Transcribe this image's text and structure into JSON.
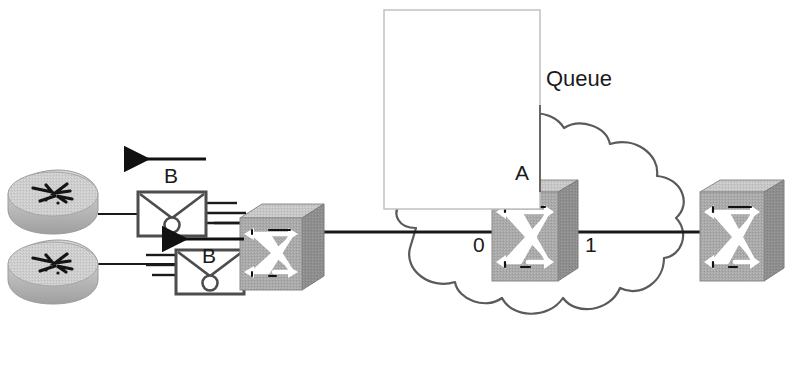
{
  "diagram": {
    "type": "network-topology",
    "title": "",
    "background_color": "#ffffff",
    "labels": {
      "queue": "Queue",
      "switch_a": "A",
      "port_0": "0",
      "port_1": "1",
      "traffic_top": "B",
      "traffic_bottom": "B"
    },
    "nodes": [
      {
        "id": "router-top",
        "kind": "router-icon",
        "label": ""
      },
      {
        "id": "router-bottom",
        "kind": "router-icon",
        "label": ""
      },
      {
        "id": "envelope-top",
        "kind": "envelope-icon",
        "label": ""
      },
      {
        "id": "envelope-bottom",
        "kind": "envelope-icon",
        "label": ""
      },
      {
        "id": "switch-left",
        "kind": "switch-icon",
        "label": ""
      },
      {
        "id": "switch-a",
        "kind": "switch-icon",
        "label": "A"
      },
      {
        "id": "switch-right",
        "kind": "switch-icon",
        "label": ""
      }
    ],
    "edges": [
      {
        "from": "router-top",
        "to": "envelope-top"
      },
      {
        "from": "router-bottom",
        "to": "envelope-bottom"
      },
      {
        "from": "envelope-top",
        "to": "switch-left"
      },
      {
        "from": "envelope-bottom",
        "to": "switch-left"
      },
      {
        "from": "switch-left",
        "to": "switch-a",
        "port": "0"
      },
      {
        "from": "switch-a",
        "to": "switch-right",
        "port": "1"
      }
    ],
    "arrows": [
      {
        "id": "arrow-b-top",
        "direction": "left",
        "label": "B"
      },
      {
        "id": "arrow-b-bottom",
        "direction": "left",
        "label": "B"
      }
    ],
    "cloud": {
      "id": "network-cloud",
      "label": ""
    },
    "overlay": {
      "id": "white-callout-rectangle",
      "label": ""
    },
    "colors": {
      "line": "#1a1a1a",
      "cloud_outline": "#555555",
      "device_body": "#a8a8a8",
      "device_top": "#c9c9c9",
      "device_side": "#8d8d8d",
      "arrow_fill": "#ffffff",
      "text": "#1a1a1a",
      "overlay_outline": "#b4b4b4"
    }
  }
}
